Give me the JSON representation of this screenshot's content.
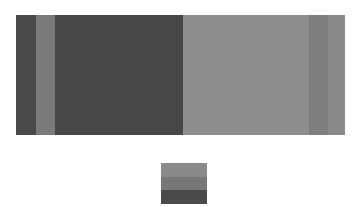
{
  "chart_data": {
    "type": "bar",
    "orientation": "horizontal-stacked",
    "title": "",
    "xlabel": "",
    "ylabel": "",
    "categories": [
      ""
    ],
    "series": [
      {
        "name": "segment-1",
        "values": [
          20
        ],
        "color": "#4a4a4a"
      },
      {
        "name": "segment-2",
        "values": [
          19
        ],
        "color": "#7a7a7a"
      },
      {
        "name": "segment-3",
        "values": [
          128
        ],
        "color": "#474747"
      },
      {
        "name": "segment-4",
        "values": [
          126
        ],
        "color": "#8e8e8e"
      },
      {
        "name": "segment-5",
        "values": [
          19
        ],
        "color": "#7e7e7e"
      },
      {
        "name": "segment-6",
        "values": [
          17
        ],
        "color": "#8a8a8a"
      }
    ],
    "total": 329,
    "grid": false,
    "legend": {
      "position": "bottom-center",
      "swatches": [
        {
          "color": "#8a8a8a"
        },
        {
          "color": "#777777"
        },
        {
          "color": "#4a4a4a"
        }
      ]
    }
  }
}
